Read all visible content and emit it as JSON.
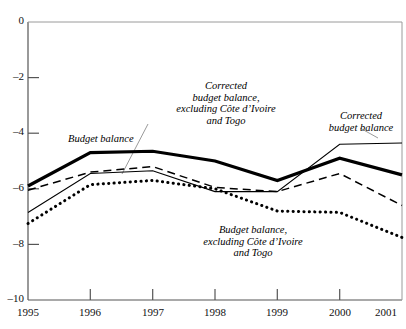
{
  "chart_data": {
    "type": "line",
    "title": "",
    "subtitle": "",
    "xlabel": "",
    "ylabel": "",
    "x": [
      1995,
      1996,
      1997,
      1998,
      1999,
      2000,
      2001
    ],
    "categories": [
      "1995",
      "1996",
      "1997",
      "1998",
      "1999",
      "2000",
      "2001"
    ],
    "xlim": [
      1995,
      2001
    ],
    "ylim": [
      -10,
      0
    ],
    "yticks": [
      0,
      -2,
      -4,
      -6,
      -8,
      -10
    ],
    "ytick_labels": [
      "0",
      "–2",
      "–4",
      "–6",
      "–8",
      "–10"
    ],
    "xticks": [
      1995,
      1996,
      1997,
      1998,
      1999,
      2000,
      2001
    ],
    "xtick_labels": [
      "1995",
      "1996",
      "1997",
      "1998",
      "1999",
      "2000",
      "2001"
    ],
    "grid": false,
    "legend_position": "inline-annotations",
    "series": [
      {
        "name": "Budget balance",
        "style": "thick-solid",
        "color": "#000000",
        "values": [
          -5.9,
          -4.7,
          -4.65,
          -5.0,
          -5.7,
          -4.9,
          -5.5
        ]
      },
      {
        "name": "Corrected budget balance, excluding Côte d’Ivoire and Togo",
        "style": "dashed",
        "color": "#000000",
        "values": [
          -6.05,
          -5.4,
          -5.2,
          -5.95,
          -6.1,
          -5.45,
          -6.6
        ]
      },
      {
        "name": "Corrected budget balance",
        "style": "thin-solid",
        "color": "#000000",
        "values": [
          -6.85,
          -5.45,
          -5.35,
          -6.1,
          -6.1,
          -4.4,
          -4.35
        ]
      },
      {
        "name": "Budget balance, excluding Côte d’Ivoire and Togo",
        "style": "dotted",
        "color": "#000000",
        "values": [
          -7.25,
          -5.85,
          -5.7,
          -6.0,
          -6.8,
          -6.85,
          -7.75
        ]
      }
    ],
    "annotations": [
      {
        "id": "budget-balance",
        "text": "Budget balance",
        "align": "left",
        "x_px": 68,
        "y_px": 133,
        "leader": false
      },
      {
        "id": "corrected-budget-balance-excl",
        "text": "Corrected\nbudget balance,\nexcluding Côte d’Ivoire\nand Togo",
        "align": "center",
        "x_px": 160,
        "y_px": 80,
        "leader": true
      },
      {
        "id": "corrected-budget-balance",
        "text": "Corrected\nbudget balance",
        "align": "center",
        "x_px": 320,
        "y_px": 110,
        "leader": true
      },
      {
        "id": "budget-balance-excl",
        "text": "Budget balance,\nexcluding Côte d’Ivoire\nand Togo",
        "align": "center",
        "x_px": 245,
        "y_px": 225,
        "leader": false
      }
    ]
  },
  "axis": {
    "y_tick_labels": [
      "0",
      "–2",
      "–4",
      "–6",
      "–8",
      "–10"
    ],
    "x_tick_labels": [
      "1995",
      "1996",
      "1997",
      "1998",
      "1999",
      "2000",
      "2001"
    ]
  },
  "colors": {
    "axis": "#444444",
    "series": "#000000",
    "background": "#ffffff",
    "leader": "#999999"
  }
}
